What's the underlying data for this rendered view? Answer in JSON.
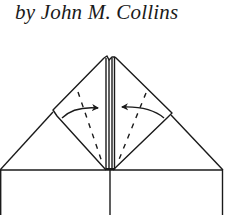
{
  "caption": {
    "author_line": "by John M. Collins"
  },
  "diagram": {
    "stroke_color": "#1a1a1a",
    "background": "#ffffff",
    "elements": [
      "outer-triangle-left",
      "outer-triangle-right",
      "left-flap",
      "right-flap",
      "center-strip",
      "left-valley-fold-dashed-line",
      "right-valley-fold-dashed-line",
      "left-fold-arrow",
      "right-fold-arrow",
      "base-rectangle"
    ]
  }
}
